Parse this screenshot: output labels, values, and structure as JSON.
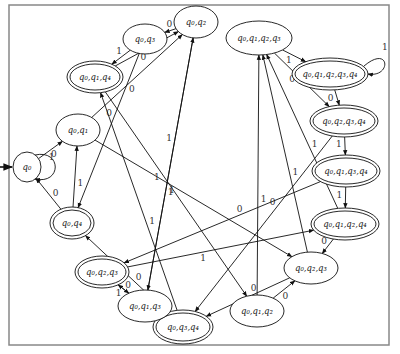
{
  "diagram": {
    "type": "dfa-state-diagram",
    "frame": {
      "x": 9,
      "y": 5,
      "w": 380,
      "h": 340,
      "stroke": "#888888"
    },
    "start_state": "q0",
    "nodes": [
      {
        "id": "q0",
        "label": "q₀",
        "cx": 27,
        "cy": 167,
        "rx": 14,
        "ry": 15,
        "accept": false
      },
      {
        "id": "q0q1",
        "label": "q₀,q₁",
        "cx": 78,
        "cy": 130,
        "rx": 22,
        "ry": 16,
        "accept": false
      },
      {
        "id": "q0q4",
        "label": "q₀,q₄",
        "cx": 72,
        "cy": 223,
        "rx": 22,
        "ry": 16,
        "accept": true
      },
      {
        "id": "q0q3",
        "label": "q₀,q₃",
        "cx": 145,
        "cy": 39,
        "rx": 22,
        "ry": 15,
        "accept": false
      },
      {
        "id": "q0q2",
        "label": "q₀,q₂",
        "cx": 196,
        "cy": 22,
        "rx": 22,
        "ry": 16,
        "accept": false
      },
      {
        "id": "q0q1q4",
        "label": "q₀,q₁,q₄",
        "cx": 95,
        "cy": 77,
        "rx": 28,
        "ry": 16,
        "accept": true
      },
      {
        "id": "q0q1q2q3",
        "label": "q₀,q₁,q₂,q₃",
        "cx": 259,
        "cy": 38,
        "rx": 33,
        "ry": 17,
        "accept": false
      },
      {
        "id": "q0q1q2q3q4",
        "label": "q₀,q₁,q₂,q₃,q₄",
        "cx": 330,
        "cy": 74,
        "rx": 38,
        "ry": 16,
        "accept": true
      },
      {
        "id": "q0q2q3q4",
        "label": "q₀,q₂,q₃,q₄",
        "cx": 344,
        "cy": 121,
        "rx": 34,
        "ry": 16,
        "accept": true
      },
      {
        "id": "q0q1q3q4",
        "label": "q₀,q₁,q₃,q₄",
        "cx": 346,
        "cy": 171,
        "rx": 34,
        "ry": 16,
        "accept": true
      },
      {
        "id": "q0q1q2q4",
        "label": "q₀,q₁,q₂,q₄",
        "cx": 345,
        "cy": 224,
        "rx": 34,
        "ry": 16,
        "accept": true
      },
      {
        "id": "q0q2q3",
        "label": "q₀,q₂,q₃",
        "cx": 311,
        "cy": 268,
        "rx": 27,
        "ry": 16,
        "accept": false
      },
      {
        "id": "q0q1q2",
        "label": "q₀,q₁,q₂",
        "cx": 257,
        "cy": 311,
        "rx": 27,
        "ry": 16,
        "accept": false
      },
      {
        "id": "q0q3q4",
        "label": "q₀,q₃,q₄",
        "cx": 183,
        "cy": 327,
        "rx": 30,
        "ry": 17,
        "accept": true
      },
      {
        "id": "q0q1q3",
        "label": "q₀,q₁,q₃",
        "cx": 145,
        "cy": 306,
        "rx": 27,
        "ry": 16,
        "accept": false
      },
      {
        "id": "q0q2q3b",
        "label": "q₀,q₂,q₃",
        "cx": 102,
        "cy": 272,
        "rx": 27,
        "ry": 16,
        "accept": true
      }
    ],
    "edges": [
      {
        "from": "q0",
        "to": "q0",
        "label": "0"
      },
      {
        "from": "q0",
        "to": "q0q1",
        "label": "1"
      },
      {
        "from": "q0q4",
        "to": "q0",
        "label": "0"
      },
      {
        "from": "q0q4",
        "to": "q0q1",
        "label": "1"
      },
      {
        "from": "q0q1",
        "to": "q0q2",
        "label": "0"
      },
      {
        "from": "q0q1",
        "to": "q0q2q3",
        "label": "1"
      },
      {
        "from": "q0q2",
        "to": "q0q3",
        "label": "0"
      },
      {
        "from": "q0q2",
        "to": "q0q1q3",
        "label": "1"
      },
      {
        "from": "q0q3",
        "to": "q0q1q4",
        "label": "1"
      },
      {
        "from": "q0q3",
        "to": "q0q4",
        "label": "0"
      },
      {
        "from": "q0q1q4",
        "to": "q0q2",
        "label": "0"
      },
      {
        "from": "q0q1q4",
        "to": "q0q1q2",
        "label": "1"
      },
      {
        "from": "q0q1q2q3",
        "to": "q0q1q2q3q4",
        "label": "1"
      },
      {
        "from": "q0q1q2q3",
        "to": "q0q2q3q4",
        "label": "0"
      },
      {
        "from": "q0q1q2q3q4",
        "to": "q0q1q2q3q4",
        "label": "1"
      },
      {
        "from": "q0q1q2q3q4",
        "to": "q0q2q3q4",
        "label": "0"
      },
      {
        "from": "q0q2q3q4",
        "to": "q0q1q3q4",
        "label": "1"
      },
      {
        "from": "q0q2q3q4",
        "to": "q0q3q4",
        "label": "0"
      },
      {
        "from": "q0q1q3q4",
        "to": "q0q1q2q4",
        "label": "1"
      },
      {
        "from": "q0q1q3q4",
        "to": "q0q2q3b",
        "label": "0"
      },
      {
        "from": "q0q1q2q4",
        "to": "q0q2q3",
        "label": "0"
      },
      {
        "from": "q0q1q2q4",
        "to": "q0q1q2q3",
        "label": "1"
      },
      {
        "from": "q0q2q3",
        "to": "q0q3q4",
        "label": "0"
      },
      {
        "from": "q0q2q3",
        "to": "q0q1q2q3",
        "label": "1"
      },
      {
        "from": "q0q1q2",
        "to": "q0q2q3",
        "label": "0"
      },
      {
        "from": "q0q1q2",
        "to": "q0q1q2q3",
        "label": "1"
      },
      {
        "from": "q0q3q4",
        "to": "q0q1q4",
        "label": "1"
      },
      {
        "from": "q0q3q4",
        "to": "q0q4",
        "label": "0"
      },
      {
        "from": "q0q1q3",
        "to": "q0q2q3b",
        "label": "0"
      },
      {
        "from": "q0q1q3",
        "to": "q0q2",
        "label": "1"
      },
      {
        "from": "q0q2q3b",
        "to": "q0q1q3",
        "label": "1"
      },
      {
        "from": "q0q2q3b",
        "to": "q0q1q2q4",
        "label": "1"
      }
    ]
  }
}
